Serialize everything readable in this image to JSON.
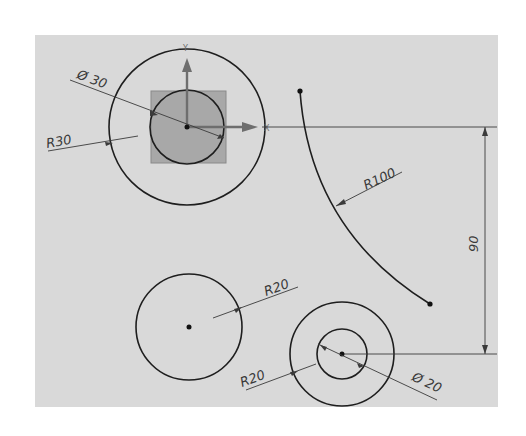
{
  "drawing": {
    "background_color": "#d9d9d9",
    "line_color": "#1e1e1e",
    "selection_fill": "#a8a8a8",
    "axis_labels": {
      "x": "X",
      "y": "Y"
    },
    "dimensions": {
      "top_diameter": "Ø 30",
      "top_radius": "R30",
      "arc_radius": "R100",
      "vertical_distance": "90",
      "left_circle_radius": "R20",
      "bottom_outer_radius": "R20",
      "bottom_diameter": "Ø 20"
    }
  }
}
